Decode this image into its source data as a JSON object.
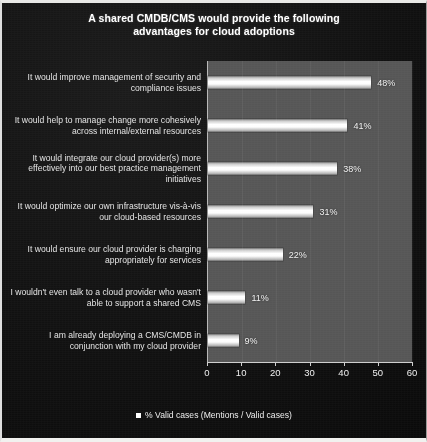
{
  "chart_data": {
    "type": "bar",
    "orientation": "horizontal",
    "title": "A shared CMDB/CMS would provide the following advantages  for cloud adoptions",
    "title_lines": [
      "A shared CMDB/CMS would provide the following",
      "advantages  for cloud adoptions"
    ],
    "categories": [
      "It would improve management of security and compliance issues",
      "It would help to manage change more cohesively across internal/external resources",
      "It would integrate our cloud provider(s) more effectively into our best practice management initiatives",
      "It would optimize our own infrastructure vis-à-vis our cloud-based resources",
      "It would ensure our cloud provider is charging appropriately for services",
      "I wouldn't even talk to a cloud provider who wasn't able to support a shared CMS",
      "I am already deploying a CMS/CMDB in conjunction with my cloud provider"
    ],
    "values": [
      48,
      41,
      38,
      31,
      22,
      11,
      9
    ],
    "value_labels": [
      "48%",
      "41%",
      "38%",
      "31%",
      "22%",
      "11%",
      "9%"
    ],
    "xlabel": "",
    "ylabel": "",
    "xlim": [
      0,
      60
    ],
    "xticks": [
      0,
      10,
      20,
      30,
      40,
      50,
      60
    ],
    "xtick_labels": [
      "0",
      "10",
      "20",
      "30",
      "40",
      "50",
      "60"
    ],
    "grid": false,
    "legend": {
      "position": "bottom",
      "entries": [
        "% Valid cases (Mentions / Valid cases)"
      ]
    },
    "series": [
      {
        "name": "% Valid cases (Mentions / Valid cases)",
        "values": [
          48,
          41,
          38,
          31,
          22,
          11,
          9
        ]
      }
    ]
  },
  "colors": {
    "background": "#111111",
    "plot_area": "#565656",
    "bar": "#ffffff",
    "text": "#eeeeee",
    "title": "#ffffff"
  }
}
